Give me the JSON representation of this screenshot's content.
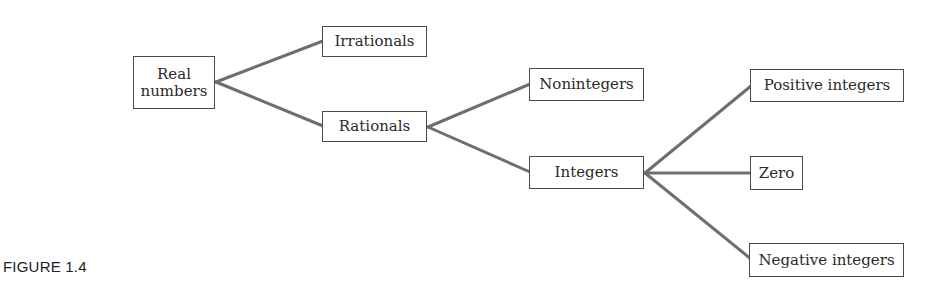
{
  "diagram": {
    "type": "tree",
    "caption": "FIGURE 1.4",
    "line_color": "#6e6e6e",
    "nodes": {
      "real": {
        "label_line1": "Real",
        "label_line2": "numbers"
      },
      "irrationals": {
        "label": "Irrationals"
      },
      "rationals": {
        "label": "Rationals"
      },
      "nonintegers": {
        "label": "Nonintegers"
      },
      "integers": {
        "label": "Integers"
      },
      "positive": {
        "label": "Positive integers"
      },
      "zero": {
        "label": "Zero"
      },
      "negative": {
        "label": "Negative integers"
      }
    },
    "edges": [
      {
        "from": "Real numbers",
        "to": "Irrationals"
      },
      {
        "from": "Real numbers",
        "to": "Rationals"
      },
      {
        "from": "Rationals",
        "to": "Nonintegers"
      },
      {
        "from": "Rationals",
        "to": "Integers"
      },
      {
        "from": "Integers",
        "to": "Positive integers"
      },
      {
        "from": "Integers",
        "to": "Zero"
      },
      {
        "from": "Integers",
        "to": "Negative integers"
      }
    ]
  }
}
